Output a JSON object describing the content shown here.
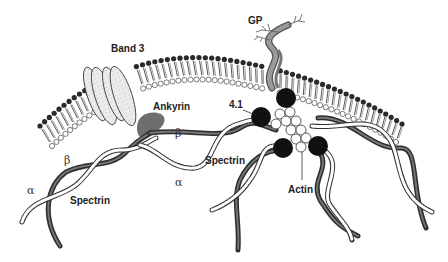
{
  "diagram": {
    "labels": {
      "band3": "Band 3",
      "gp": "GP",
      "ankyrin": "Ankyrin",
      "protein41": "4.1",
      "actin": "Actin",
      "spectrin_left": "Spectrin",
      "spectrin_center": "Spectrin",
      "beta_left": "β",
      "alpha_left": "α",
      "beta_center": "β",
      "alpha_center": "α"
    },
    "colors": {
      "head_dark": "#2a2a2a",
      "head_light": "#ffffff",
      "tail": "#555555",
      "ankyrin": "#6e6e6e",
      "gp": "#8a8a8a",
      "node_41": "#111111",
      "beta_strand": "#3a3a3a",
      "alpha_strand": "#ffffff"
    },
    "components": [
      "Lipid bilayer",
      "Band 3",
      "Glycophorin (GP)",
      "Ankyrin",
      "Protein 4.1",
      "Actin",
      "α-Spectrin",
      "β-Spectrin"
    ]
  }
}
